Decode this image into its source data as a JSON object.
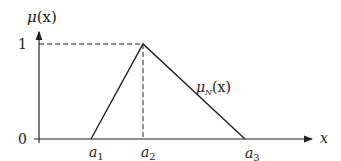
{
  "diagram": {
    "type": "triangular-membership-function",
    "y_axis_label": {
      "base": "μ",
      "arg": "(x)"
    },
    "x_axis_label": "x",
    "y_ticks": [
      "0",
      "1"
    ],
    "x_ticks": [
      {
        "base": "a",
        "sub": "1"
      },
      {
        "base": "a",
        "sub": "2"
      },
      {
        "base": "a",
        "sub": "3"
      }
    ],
    "curve_label": {
      "base": "μ",
      "sub": "N",
      "arg": "(x)"
    },
    "colors": {
      "line": "#222222",
      "background": "#ffffff"
    }
  }
}
